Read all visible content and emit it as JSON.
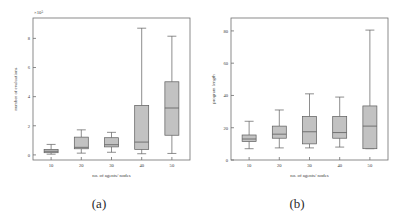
{
  "figure": {
    "panels": [
      {
        "caption": "(a)",
        "chart_data": {
          "type": "box",
          "title": "",
          "xlabel": "no. of agents/ nodes",
          "ylabel": "number of evaluations",
          "exponent_label": "×10⁵",
          "categories": [
            "10",
            "20",
            "30",
            "40",
            "50"
          ],
          "xticks": [
            10,
            20,
            30,
            40,
            50
          ],
          "yticks": [
            0,
            2,
            4,
            6,
            8
          ],
          "ylim": [
            -0.35,
            9.4
          ],
          "xlim": [
            4,
            56
          ],
          "grid": false,
          "legend": null,
          "boxes": [
            {
              "category": "10",
              "whisker_low": 0.05,
              "q1": 0.15,
              "median": 0.25,
              "q3": 0.38,
              "whisker_high": 0.72
            },
            {
              "category": "20",
              "whisker_low": 0.12,
              "q1": 0.42,
              "median": 0.52,
              "q3": 1.22,
              "whisker_high": 1.72
            },
            {
              "category": "30",
              "whisker_low": 0.18,
              "q1": 0.55,
              "median": 0.7,
              "q3": 1.18,
              "whisker_high": 1.55
            },
            {
              "category": "40",
              "whisker_low": 0.08,
              "q1": 0.38,
              "median": 0.88,
              "q3": 3.4,
              "whisker_high": 8.7
            },
            {
              "category": "50",
              "whisker_low": 0.1,
              "q1": 1.35,
              "median": 3.22,
              "q3": 5.02,
              "whisker_high": 8.15
            }
          ]
        }
      },
      {
        "caption": "(b)",
        "chart_data": {
          "type": "box",
          "title": "",
          "xlabel": "no. of agents/ nodes",
          "ylabel": "program length",
          "exponent_label": "",
          "categories": [
            "10",
            "20",
            "30",
            "40",
            "50"
          ],
          "xticks": [
            10,
            20,
            30,
            40,
            50
          ],
          "yticks": [
            0,
            20,
            40,
            60,
            80
          ],
          "ylim": [
            0,
            88
          ],
          "xlim": [
            4,
            56
          ],
          "grid": false,
          "legend": null,
          "boxes": [
            {
              "category": "10",
              "whisker_low": 7.0,
              "q1": 11.5,
              "median": 13.0,
              "q3": 15.5,
              "whisker_high": 24.0
            },
            {
              "category": "20",
              "whisker_low": 7.5,
              "q1": 13.5,
              "median": 16.0,
              "q3": 21.0,
              "whisker_high": 31.0
            },
            {
              "category": "30",
              "whisker_low": 7.5,
              "q1": 10.0,
              "median": 17.5,
              "q3": 27.0,
              "whisker_high": 41.0
            },
            {
              "category": "40",
              "whisker_low": 8.0,
              "q1": 13.5,
              "median": 17.0,
              "q3": 27.0,
              "whisker_high": 39.0
            },
            {
              "category": "50",
              "whisker_low": 7.0,
              "q1": 7.0,
              "median": 21.0,
              "q3": 33.5,
              "whisker_high": 80.5
            }
          ]
        }
      }
    ],
    "colors": {
      "box_fill": "#c2c2c2",
      "box_stroke": "#5d5d5d",
      "axis": "#6e6e6e",
      "text": "#3a3a3a",
      "background": "#ffffff"
    }
  }
}
